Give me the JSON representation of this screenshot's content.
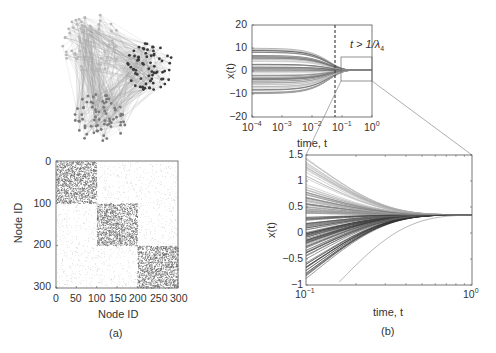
{
  "panels": {
    "a": {
      "caption": "(a)",
      "network": {
        "description": "three-community network graph",
        "clusters": [
          {
            "name": "light",
            "color": "#b8b8b8",
            "cx": 92,
            "cy": 44,
            "r": 30
          },
          {
            "name": "dark",
            "color": "#3a3a3a",
            "cx": 150,
            "cy": 67,
            "r": 24
          },
          {
            "name": "medium",
            "color": "#7a7a7a",
            "cx": 100,
            "cy": 118,
            "r": 26
          }
        ]
      },
      "matrix": {
        "xlabel": "Node ID",
        "ylabel": "Node ID",
        "xticks": [
          "0",
          "50",
          "100",
          "150",
          "200",
          "250",
          "300"
        ],
        "yticks": [
          "0",
          "100",
          "200",
          "300"
        ]
      }
    },
    "b": {
      "caption": "(b)",
      "annotation": "t > 1/λ",
      "annotation_sub": "4"
    }
  },
  "chart_data": [
    {
      "type": "heatmap",
      "title": "Adjacency matrix",
      "xlabel": "Node ID",
      "ylabel": "Node ID",
      "xlim": [
        0,
        300
      ],
      "ylim": [
        300,
        0
      ],
      "xticks": [
        0,
        50,
        100,
        150,
        200,
        250,
        300
      ],
      "yticks": [
        0,
        100,
        200,
        300
      ],
      "blocks": [
        {
          "rows": [
            0,
            100
          ],
          "cols": [
            0,
            100
          ],
          "density": "high"
        },
        {
          "rows": [
            100,
            200
          ],
          "cols": [
            100,
            200
          ],
          "density": "high"
        },
        {
          "rows": [
            200,
            300
          ],
          "cols": [
            200,
            300
          ],
          "density": "high"
        }
      ],
      "off_block_density": "low"
    },
    {
      "type": "line",
      "title": "",
      "xlabel": "time, t",
      "ylabel": "x(t)",
      "xscale": "log",
      "xlim": [
        0.0001,
        1
      ],
      "ylim": [
        -20,
        20
      ],
      "xticks": [
        "10^-4",
        "10^-3",
        "10^-2",
        "10^-1",
        "10^0"
      ],
      "yticks": [
        20,
        10,
        0,
        -10,
        -20
      ],
      "initial_range": [
        -10,
        10
      ],
      "converges_to": 0.35,
      "vertical_dashed_line_x": 0.06,
      "annotation": "t > 1/λ4",
      "zoom_box": {
        "x": [
          0.1,
          1
        ],
        "y": [
          -5,
          6
        ]
      }
    },
    {
      "type": "line",
      "title": "",
      "xlabel": "time, t",
      "ylabel": "x(t)",
      "xscale": "log",
      "xlim": [
        0.1,
        1
      ],
      "ylim": [
        -1,
        1.5
      ],
      "xticks": [
        "10^-1",
        "10^0"
      ],
      "yticks": [
        1.5,
        1,
        0.5,
        0,
        -0.5,
        -1
      ],
      "range_at_t0.1": [
        -1.3,
        1.45
      ],
      "converges_to": 0.35
    }
  ],
  "top_plot": {
    "ylabel": "x(t)",
    "xlabel": "time, t",
    "yticks": [
      "20",
      "10",
      "0",
      "−10",
      "−20"
    ],
    "xticks": [
      {
        "base": "10",
        "exp": "−4"
      },
      {
        "base": "10",
        "exp": "−3"
      },
      {
        "base": "10",
        "exp": "−2"
      },
      {
        "base": "10",
        "exp": "−1"
      },
      {
        "base": "10",
        "exp": "0"
      }
    ]
  },
  "bottom_plot": {
    "ylabel": "x(t)",
    "xlabel": "time, t",
    "yticks": [
      "1.5",
      "1",
      "0.5",
      "0",
      "−0.5",
      "−1"
    ],
    "xticks": [
      {
        "base": "10",
        "exp": "−1"
      },
      {
        "base": "10",
        "exp": "0"
      }
    ]
  }
}
